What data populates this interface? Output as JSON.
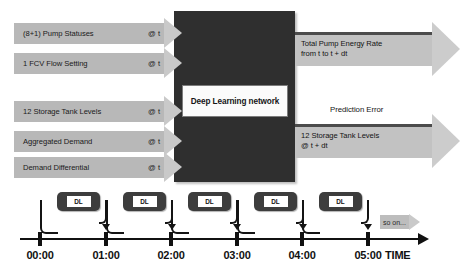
{
  "diagram": {
    "core": {
      "label": "Deep Learning network"
    },
    "inputs": [
      {
        "label": "(8+1) Pump Statuses",
        "time": "@ t",
        "top": 18,
        "left": 14,
        "body_width": 150
      },
      {
        "label": "1 FCV Flow Setting",
        "time": "@ t",
        "top": 48,
        "left": 14,
        "body_width": 150
      },
      {
        "label": "12 Storage Tank Levels",
        "time": "@ t",
        "top": 96,
        "left": 14,
        "body_width": 150
      },
      {
        "label": "Aggregated Demand",
        "time": "@ t",
        "top": 126,
        "left": 14,
        "body_width": 150
      },
      {
        "label": "Demand Differential",
        "time": "@ t",
        "top": 152,
        "left": 14,
        "body_width": 150
      }
    ],
    "outputs": [
      {
        "text": "Total Pump Energy Rate\nfrom t to t + dt",
        "top": 22,
        "left": 295,
        "body_width": 137
      },
      {
        "text": "12 Storage Tank Levels\n@ t + dt",
        "top": 114,
        "left": 295,
        "body_width": 137
      }
    ],
    "prediction_error_label": "Prediction Error",
    "timeline": {
      "axis_label": "TIME",
      "ticks": [
        {
          "label": "00:00",
          "x": 40
        },
        {
          "label": "01:00",
          "x": 106
        },
        {
          "label": "02:00",
          "x": 171
        },
        {
          "label": "03:00",
          "x": 237
        },
        {
          "label": "04:00",
          "x": 302
        },
        {
          "label": "05:00",
          "x": 368
        }
      ],
      "steps": [
        {
          "label": "DL",
          "x": 57,
          "width": 43
        },
        {
          "label": "DL",
          "x": 123,
          "width": 43
        },
        {
          "label": "DL",
          "x": 188,
          "width": 43
        },
        {
          "label": "DL",
          "x": 254,
          "width": 43
        },
        {
          "label": "DL",
          "x": 319,
          "width": 43
        }
      ],
      "continuation_label": "so on..."
    },
    "colors": {
      "core_block": "#2f2f2f",
      "input_arrow": "#b8b8b8",
      "output_arrow": "#c2c2c2",
      "arrow_head": "#cccccc",
      "timeline_stroke": "#111111",
      "dl_box": "#3d3d3d"
    }
  }
}
